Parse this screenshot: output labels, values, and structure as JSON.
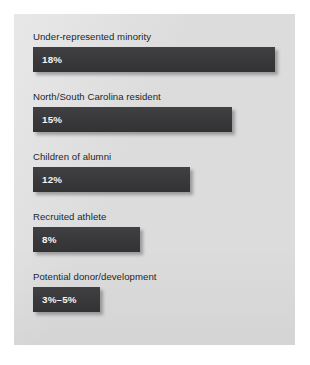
{
  "figure": {
    "panel_background": "#dcdcdc",
    "page_background": "#ffffff",
    "bar_color": "#3a3a3c",
    "label_color": "#23262a",
    "value_color": "#f4f4f4"
  },
  "chart_data": {
    "type": "bar",
    "orientation": "horizontal",
    "title": "",
    "subtitle": "",
    "xlabel": "",
    "ylabel": "",
    "xlim": [
      0,
      20
    ],
    "grid": false,
    "legend": null,
    "axis_visible": false,
    "tick_labels": [],
    "value_label_position": "inside-left",
    "categories": [
      "Under-represented minority",
      "North/South Carolina resident",
      "Children of alumni",
      "Recruited athlete",
      "Potential donor/development"
    ],
    "values": [
      18,
      15,
      12,
      8,
      4
    ],
    "value_labels": [
      "18%",
      "15%",
      "12%",
      "8%",
      "3%–5%"
    ],
    "bars": [
      {
        "category": "Under-represented minority",
        "value": 18,
        "value_label": "18%",
        "bar_width_px": 242
      },
      {
        "category": "North/South Carolina resident",
        "value": 15,
        "value_label": "15%",
        "bar_width_px": 199
      },
      {
        "category": "Children of alumni",
        "value": 12,
        "value_label": "12%",
        "bar_width_px": 157
      },
      {
        "category": "Recruited athlete",
        "value": 8,
        "value_label": "8%",
        "bar_width_px": 107
      },
      {
        "category": "Potential donor/development",
        "value": 4,
        "value_label": "3%–5%",
        "bar_width_px": 67,
        "value_range": [
          3,
          5
        ]
      }
    ]
  }
}
